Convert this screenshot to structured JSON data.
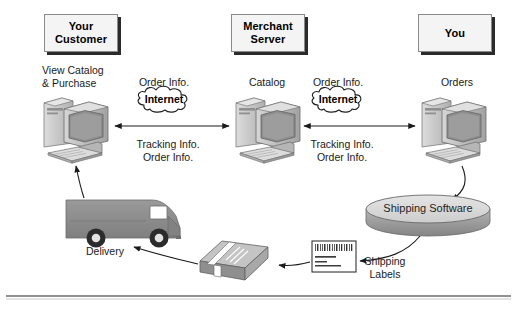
{
  "diagram": {
    "colors": {
      "box_fill": "#f4f4f4",
      "box_border": "#8a8a8a",
      "box_shadow": "#2b2b2b",
      "line": "#1a1a1a",
      "truck_body": "#8c8c8c",
      "disc_top": "#d8d8d8",
      "disc_side": "#9a9a9a",
      "computer_light": "#d2d2d2",
      "computer_mid": "#a9a9a9",
      "computer_dark": "#7d7d7d",
      "screen": "#8e8e8e",
      "package_top": "#bdbdbd",
      "package_front": "#8f8f8f",
      "background": "#ffffff",
      "rule": "#6d6d6d"
    },
    "roles": [
      {
        "id": "customer",
        "label": "Your\nCustomer"
      },
      {
        "id": "merchant",
        "label": "Merchant\nServer"
      },
      {
        "id": "you",
        "label": "You"
      }
    ],
    "captions": {
      "customer_action": "View Catalog\n& Purchase",
      "catalog": "Catalog",
      "orders": "Orders",
      "order_info_left": "Order Info.",
      "order_info_right": "Order Info.",
      "tracking_left": "Tracking Info.\nOrder Info.",
      "tracking_right": "Tracking Info.\nOrder Info.",
      "delivery": "Delivery",
      "shipping_labels": "Shipping\nLabels"
    },
    "clouds": [
      {
        "id": "cloud-left",
        "label": "Internet"
      },
      {
        "id": "cloud-right",
        "label": "Internet"
      }
    ],
    "disc": {
      "label": "Shipping Software"
    },
    "shipping_label_art": {
      "barcode_bars": 34,
      "text_lines": [
        "JOHN DOE/3ABC",
        "1 Ship Road",
        "Fairfax, VA USA  0712"
      ]
    },
    "nodes": [
      {
        "id": "computer-customer",
        "name": "customer-computer"
      },
      {
        "id": "computer-merchant",
        "name": "merchant-server-computer"
      },
      {
        "id": "computer-you",
        "name": "your-computer"
      },
      {
        "id": "truck",
        "name": "delivery-truck"
      },
      {
        "id": "package",
        "name": "shipping-package"
      },
      {
        "id": "label",
        "name": "shipping-label"
      },
      {
        "id": "disc",
        "name": "shipping-software-disc"
      }
    ],
    "connectors": [
      {
        "id": "c1",
        "from": "computer-customer",
        "to": "computer-merchant",
        "kind": "double-arrow"
      },
      {
        "id": "c2",
        "from": "computer-you",
        "to": "computer-merchant",
        "kind": "double-arrow"
      },
      {
        "id": "c3",
        "from": "computer-you",
        "to": "disc",
        "kind": "arrow"
      },
      {
        "id": "c4",
        "from": "disc",
        "to": "label",
        "kind": "arrow"
      },
      {
        "id": "c5",
        "from": "label",
        "to": "package",
        "kind": "arrow"
      },
      {
        "id": "c6",
        "from": "package",
        "to": "truck",
        "kind": "arrow"
      },
      {
        "id": "c7",
        "from": "truck",
        "to": "computer-customer",
        "kind": "arrow"
      }
    ]
  }
}
